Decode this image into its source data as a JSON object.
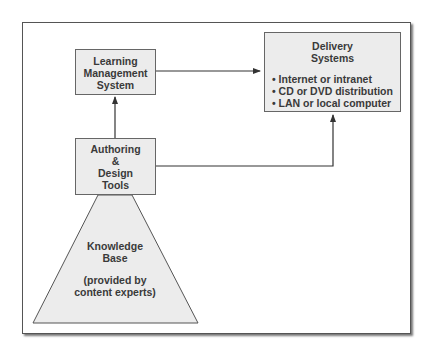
{
  "diagram": {
    "nodes": {
      "lms": {
        "lines": [
          "Learning",
          "Management",
          "System"
        ]
      },
      "authoring": {
        "lines": [
          "Authoring",
          "&",
          "Design",
          "Tools"
        ]
      },
      "delivery": {
        "title_lines": [
          "Delivery",
          "Systems"
        ],
        "items": [
          "• Internet or intranet",
          "• CD or DVD distribution",
          "• LAN or local computer"
        ]
      },
      "knowledge_base": {
        "title_lines": [
          "Knowledge",
          "Base"
        ],
        "subtitle_lines": [
          "(provided by",
          "content experts)"
        ]
      }
    },
    "edges": [
      {
        "from": "authoring",
        "to": "lms"
      },
      {
        "from": "lms",
        "to": "delivery"
      },
      {
        "from": "authoring",
        "to": "delivery"
      },
      {
        "from": "knowledge_base",
        "to": "authoring"
      }
    ],
    "colors": {
      "box_fill": "#ececec",
      "stroke": "#555555",
      "text": "#3a3a3a"
    }
  }
}
